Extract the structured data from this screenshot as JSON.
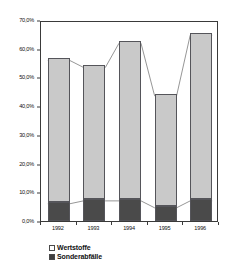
{
  "chart_data": {
    "type": "bar",
    "subtype": "stacked-bar-with-connectors",
    "title": "",
    "subtitle": "",
    "xlabel": "",
    "ylabel": "",
    "categories": [
      "1992",
      "1993",
      "1994",
      "1995",
      "1996"
    ],
    "series": [
      {
        "name": "Wertstoffe",
        "values": [
          49.9,
          46.5,
          54.9,
          39.0,
          57.7
        ],
        "color": "#c9c9c9",
        "fill": "light-dotted-hatch"
      },
      {
        "name": "Sonderabfälle",
        "values": [
          6.7,
          7.7,
          7.7,
          5.3,
          7.7
        ],
        "color": "#6d6d6d",
        "fill": "dark-dense-hatch"
      }
    ],
    "totals": [
      56.6,
      54.2,
      62.6,
      44.3,
      65.4
    ],
    "ylim": [
      0.0,
      70.0
    ],
    "yticks": [
      0.0,
      10.0,
      20.0,
      30.0,
      40.0,
      50.0,
      60.0,
      70.0
    ],
    "ytick_labels": [
      "0,0%",
      "10,0%",
      "20,0%",
      "30,0%",
      "40,0%",
      "50,0%",
      "60,0%",
      "70,0%"
    ],
    "grid": false,
    "legend_position": "bottom-left",
    "connectors": [
      {
        "name": "total-connector",
        "values": [
          56.6,
          54.2,
          62.6,
          44.3,
          65.4
        ]
      },
      {
        "name": "sonderabfaelle-connector",
        "values": [
          6.7,
          7.7,
          7.7,
          5.3,
          7.7
        ]
      }
    ]
  },
  "axis": {
    "y": {
      "ticks": [
        {
          "label": "70,0%",
          "value": 70.0
        },
        {
          "label": "60,0%",
          "value": 60.0
        },
        {
          "label": "50,0%",
          "value": 50.0
        },
        {
          "label": "40,0%",
          "value": 40.0
        },
        {
          "label": "30,0%",
          "value": 30.0
        },
        {
          "label": "20,0%",
          "value": 20.0
        },
        {
          "label": "10,0%",
          "value": 10.0
        },
        {
          "label": "0,0%",
          "value": 0.0
        }
      ]
    },
    "x": {
      "ticks": [
        {
          "label": "1992"
        },
        {
          "label": "1993"
        },
        {
          "label": "1994"
        },
        {
          "label": "1995"
        },
        {
          "label": "1996"
        }
      ]
    }
  },
  "legend": {
    "items": [
      {
        "label": "Wertstoffe",
        "swatch": "light-dotted-swatch"
      },
      {
        "label": "Sonderabfälle",
        "swatch": "dark-hatch-swatch"
      }
    ]
  }
}
